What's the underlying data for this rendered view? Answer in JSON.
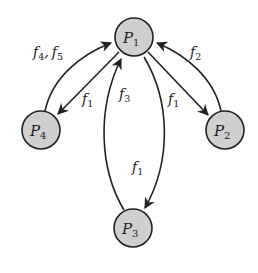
{
  "diagram": {
    "type": "directed-graph",
    "nodes": [
      {
        "id": "P1",
        "base": "P",
        "sub": "1",
        "x": 134,
        "y": 37
      },
      {
        "id": "P2",
        "base": "P",
        "sub": "2",
        "x": 225,
        "y": 130
      },
      {
        "id": "P3",
        "base": "P",
        "sub": "3",
        "x": 133,
        "y": 228
      },
      {
        "id": "P4",
        "base": "P",
        "sub": "4",
        "x": 41,
        "y": 130
      }
    ],
    "edges": [
      {
        "from": "P4",
        "to": "P1",
        "label": "f4, f5",
        "style": "outer-curve"
      },
      {
        "from": "P1",
        "to": "P4",
        "label": "f1",
        "style": "straight"
      },
      {
        "from": "P2",
        "to": "P1",
        "label": "f2",
        "style": "outer-curve"
      },
      {
        "from": "P1",
        "to": "P2",
        "label": "f1",
        "style": "straight"
      },
      {
        "from": "P3",
        "to": "P1",
        "label": "f3",
        "style": "curve-left"
      },
      {
        "from": "P1",
        "to": "P3",
        "label": "f1",
        "style": "curve-right"
      }
    ],
    "labels": {
      "f45": {
        "a": "f",
        "a_sub": "4",
        "sep": ",",
        "b": "f",
        "b_sub": "5"
      },
      "f1_left": {
        "base": "f",
        "sub": "1"
      },
      "f2": {
        "base": "f",
        "sub": "2"
      },
      "f1_right": {
        "base": "f",
        "sub": "1"
      },
      "f3": {
        "base": "f",
        "sub": "3"
      },
      "f1_bottom": {
        "base": "f",
        "sub": "1"
      }
    },
    "colors": {
      "node_fill": "#cfcfcf",
      "stroke": "#222222",
      "background": "#ffffff"
    }
  }
}
